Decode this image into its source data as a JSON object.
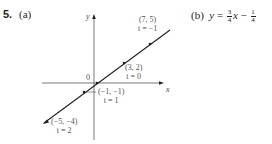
{
  "problem": {
    "number": "5.",
    "part_a_label": "(a)",
    "part_b_label": "(b)",
    "part_b_equation": {
      "lhs": "y",
      "eq": "=",
      "coef_num": "3",
      "coef_den": "4",
      "var": "x",
      "minus": "−",
      "const_num": "1",
      "const_den": "4"
    }
  },
  "graph": {
    "x_axis_label": "x",
    "y_axis_label": "y",
    "origin_label": "0",
    "line_color": "#231f20",
    "points": [
      {
        "coord": "(7, 5)",
        "param": "t = −1"
      },
      {
        "coord": "(3, 2)",
        "param": "t = 0"
      },
      {
        "coord": "(−1, −1)",
        "param": "t = 1"
      },
      {
        "coord": "(−5, −4)",
        "param": "t = 2"
      }
    ]
  }
}
